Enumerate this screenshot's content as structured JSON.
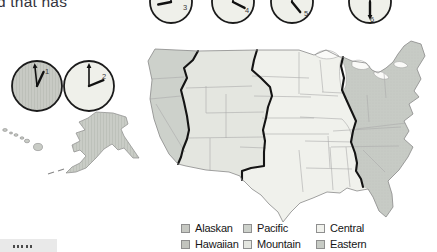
{
  "page": {
    "fragment_text": "d that has",
    "background": "#ffffff"
  },
  "clocks": [
    {
      "digit": "1",
      "hour_deg": 25,
      "minute_deg": -6,
      "face": "#c8cac4",
      "textured": true,
      "arrow_on": "minute"
    },
    {
      "digit": "2",
      "hour_deg": 68,
      "minute_deg": 0,
      "face": "#eff0ea",
      "textured": false,
      "arrow_on": "minute"
    },
    {
      "digit": "3",
      "hour_deg": 259,
      "minute_deg": 0,
      "face": "#eff0ea",
      "textured": false,
      "arrow_on": "minute"
    },
    {
      "digit": "4",
      "hour_deg": 117,
      "minute_deg": 0,
      "face": "#eff0ea",
      "textured": false,
      "arrow_on": "minute"
    },
    {
      "digit": "5",
      "hour_deg": 141,
      "minute_deg": 0,
      "face": "#eff0ea",
      "textured": false,
      "arrow_on": "minute"
    },
    {
      "digit": "6",
      "hour_deg": 180,
      "minute_deg": 0,
      "face": "#eff0ea",
      "textured": false,
      "arrow_on": "hour"
    }
  ],
  "map": {
    "zones": [
      {
        "name": "Pacific",
        "color": "#cdd1cb"
      },
      {
        "name": "Mountain",
        "color": "#e4e6e0"
      },
      {
        "name": "Central",
        "color": "#f0f1ec"
      },
      {
        "name": "Eastern",
        "color": "#c7cbc5"
      },
      {
        "name": "Alaskan",
        "color": "#c9ccc6"
      },
      {
        "name": "Hawaiian",
        "color": "#c9ccc6"
      }
    ],
    "colors": {
      "boundary": "#141414",
      "state_line": "#ababab",
      "coast": "#8a8a8a",
      "lake": "#fafaf8",
      "clock_outline": "#1b1b1b"
    }
  },
  "legend": {
    "rows": [
      [
        {
          "label": "Alaskan",
          "color": "#c6c8c2"
        },
        {
          "label": "Pacific",
          "color": "#cdd1cb"
        },
        {
          "label": "Central",
          "color": "#f0f1ec"
        }
      ],
      [
        {
          "label": "Hawaiian",
          "color": "#c2c4be"
        },
        {
          "label": "Mountain",
          "color": "#e4e6e0"
        },
        {
          "label": "Eastern",
          "color": "#c7cbc5"
        }
      ]
    ]
  }
}
